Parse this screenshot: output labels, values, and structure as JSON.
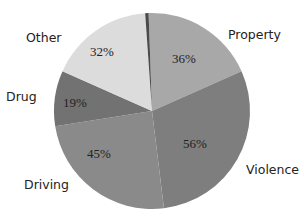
{
  "chart_data": {
    "type": "pie",
    "title": "",
    "start_angle_deg": -2,
    "slices": [
      {
        "label": "Property",
        "value_label": "36%",
        "angle_deg": 68,
        "color": "#a8a8a8"
      },
      {
        "label": "Violence",
        "value_label": "56%",
        "angle_deg": 107,
        "color": "#7e7e7e"
      },
      {
        "label": "Driving",
        "value_label": "45%",
        "angle_deg": 88,
        "color": "#8a8a8a"
      },
      {
        "label": "Drug",
        "value_label": "19%",
        "angle_deg": 33,
        "color": "#727272"
      },
      {
        "label": "Other",
        "value_label": "32%",
        "angle_deg": 62,
        "color": "#dcdcdc"
      },
      {
        "label": "",
        "value_label": "",
        "angle_deg": 2,
        "color": "#4a4a4a"
      }
    ],
    "legend": "none",
    "data_labels": "inside"
  },
  "labels": {
    "property": "Property",
    "violence": "Violence",
    "driving": "Driving",
    "drug": "Drug",
    "other": "Other"
  },
  "values": {
    "property": "36%",
    "violence": "56%",
    "driving": "45%",
    "drug": "19%",
    "other": "32%"
  }
}
